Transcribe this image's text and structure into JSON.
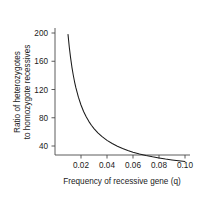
{
  "chart_data": {
    "type": "line",
    "title": "",
    "xlabel": "Frequency of recessive gene (q)",
    "ylabel_line1": "Ratio of heterozygotes",
    "ylabel_line2": "to homozygote recessives",
    "ylabel": "Ratio of heterozygotes to homozygote recessives",
    "xlim": [
      0.005,
      0.105
    ],
    "ylim": [
      20,
      215
    ],
    "grid": false,
    "legend": false,
    "xticks": [
      0.02,
      0.04,
      0.06,
      0.08,
      0.1
    ],
    "xtick_labels": [
      "0.02",
      "0.04",
      "0.06",
      "0.08",
      "0.10"
    ],
    "yticks": [
      40,
      80,
      120,
      160,
      200
    ],
    "ytick_labels": [
      "40",
      "80",
      "120",
      "160",
      "200"
    ],
    "series": [
      {
        "name": "2(1-q)/q",
        "color": "#1a1a1a",
        "x": [
          0.01,
          0.011,
          0.012,
          0.013,
          0.014,
          0.015,
          0.016,
          0.018,
          0.02,
          0.022,
          0.024,
          0.026,
          0.028,
          0.03,
          0.033,
          0.036,
          0.04,
          0.044,
          0.048,
          0.052,
          0.056,
          0.06,
          0.065,
          0.07,
          0.075,
          0.08,
          0.085,
          0.09,
          0.095,
          0.1
        ],
        "values": [
          198.0,
          179.8,
          164.7,
          151.8,
          140.9,
          131.3,
          123.0,
          109.1,
          98.0,
          88.9,
          81.3,
          74.9,
          69.4,
          64.7,
          58.6,
          53.6,
          48.0,
          43.5,
          39.7,
          36.5,
          33.7,
          31.3,
          28.8,
          26.6,
          24.7,
          23.0,
          21.5,
          20.2,
          19.1,
          18.0
        ]
      }
    ],
    "annotations": []
  },
  "geometry": {
    "plot_left_px": 55,
    "plot_right_px": 188,
    "plot_bottom_px": 155,
    "tick_y_200_px": 33,
    "tick_y_160_px": 61.25,
    "tick_y_120_px": 89.5,
    "tick_y_80_px": 117.75,
    "tick_y_40_px": 146,
    "tick_x_002_px": 81,
    "tick_x_004_px": 107,
    "tick_x_006_px": 133,
    "tick_x_008_px": 159,
    "tick_x_010_px": 185
  }
}
